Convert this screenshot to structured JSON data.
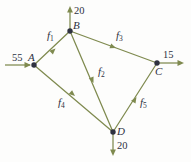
{
  "diagram": {
    "kind": "network-flow-graph",
    "colors": {
      "background": "#fdfdfc",
      "edge": "#7f8a4f",
      "node": "#2f3240",
      "label": "#2d3142"
    },
    "nodes": [
      {
        "id": "A",
        "label": "A",
        "x": 34,
        "y": 65
      },
      {
        "id": "B",
        "label": "B",
        "x": 70,
        "y": 31
      },
      {
        "id": "C",
        "label": "C",
        "x": 157,
        "y": 63
      },
      {
        "id": "D",
        "label": "D",
        "x": 113,
        "y": 132
      }
    ],
    "edges": [
      {
        "id": "f1",
        "label": "f",
        "sub": "1",
        "from": "A",
        "to": "B"
      },
      {
        "id": "f2",
        "label": "f",
        "sub": "2",
        "from": "B",
        "to": "D"
      },
      {
        "id": "f3",
        "label": "f",
        "sub": "3",
        "from": "B",
        "to": "C"
      },
      {
        "id": "f4",
        "label": "f",
        "sub": "4",
        "from": "A",
        "to": "D"
      },
      {
        "id": "f5",
        "label": "f",
        "sub": "5",
        "from": "D",
        "to": "C"
      }
    ],
    "external_flows": [
      {
        "id": "inflow-A",
        "value": "55",
        "at": "A",
        "direction": "right"
      },
      {
        "id": "outflow-B",
        "value": "20",
        "at": "B",
        "direction": "up"
      },
      {
        "id": "outflow-C",
        "value": "15",
        "at": "C",
        "direction": "right"
      },
      {
        "id": "outflow-D",
        "value": "20",
        "at": "D",
        "direction": "down"
      }
    ]
  }
}
